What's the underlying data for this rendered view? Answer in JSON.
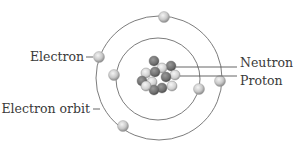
{
  "diagram": {
    "labels": {
      "electron": "Electron",
      "electron_orbit": "Electron orbit",
      "neutron": "Neutron",
      "proton": "Proton"
    },
    "colors": {
      "neutron": "#6f6f6f",
      "proton": "#d8d8d8",
      "electron": "#c9c9c9",
      "orbit": "#6d6d6d",
      "text": "#3a3a3a"
    },
    "orbits": [
      {
        "name": "inner-orbit",
        "cx": 158,
        "cy": 79,
        "rx": 42,
        "ry": 41
      },
      {
        "name": "outer-orbit",
        "cx": 159,
        "cy": 78,
        "rx": 63,
        "ry": 62
      }
    ],
    "electrons": [
      {
        "cx": 164,
        "cy": 17
      },
      {
        "cx": 99,
        "cy": 57
      },
      {
        "cx": 220,
        "cy": 81
      },
      {
        "cx": 123,
        "cy": 126
      },
      {
        "cx": 114,
        "cy": 75
      },
      {
        "cx": 199,
        "cy": 89
      }
    ],
    "nucleus": {
      "particles": [
        {
          "cx": 154,
          "cy": 61,
          "type": "neutron"
        },
        {
          "cx": 171,
          "cy": 66,
          "type": "neutron"
        },
        {
          "cx": 162,
          "cy": 68,
          "type": "proton"
        },
        {
          "cx": 146,
          "cy": 73,
          "type": "proton"
        },
        {
          "cx": 155,
          "cy": 72,
          "type": "neutron"
        },
        {
          "cx": 175,
          "cy": 75,
          "type": "proton"
        },
        {
          "cx": 166,
          "cy": 77,
          "type": "neutron"
        },
        {
          "cx": 142,
          "cy": 81,
          "type": "neutron"
        },
        {
          "cx": 152,
          "cy": 82,
          "type": "proton"
        },
        {
          "cx": 172,
          "cy": 86,
          "type": "proton"
        },
        {
          "cx": 162,
          "cy": 88,
          "type": "neutron"
        },
        {
          "cx": 154,
          "cy": 90,
          "type": "neutron"
        },
        {
          "cx": 146,
          "cy": 86,
          "type": "proton"
        }
      ]
    }
  }
}
